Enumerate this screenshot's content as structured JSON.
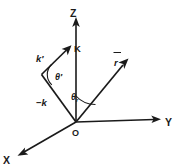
{
  "figure": {
    "background_color": "#ffffff",
    "ink_color": "#1a1a1a",
    "origin_label": "O"
  },
  "axes": [
    {
      "id": "x",
      "label": "X",
      "direction": "down-left",
      "arrow": true
    },
    {
      "id": "y",
      "label": "Y",
      "direction": "right",
      "arrow": true
    },
    {
      "id": "z",
      "label": "Z",
      "direction": "up",
      "arrow": true
    }
  ],
  "vectors": [
    {
      "id": "k-prime",
      "label": "k",
      "prime": "′",
      "overbar": false,
      "arrow": true,
      "description": "arrow from vertex up-right toward K"
    },
    {
      "id": "k-capital",
      "label": "K",
      "prime": "",
      "overbar": false,
      "arrow": false,
      "description": "label at tip near Z axis"
    },
    {
      "id": "minus-k",
      "label": "−k",
      "prime": "",
      "overbar": false,
      "arrow": false,
      "description": "segment from origin up-left to vertex"
    },
    {
      "id": "r-vector",
      "label": "r",
      "prime": "",
      "overbar": true,
      "arrow": true,
      "description": "arrow from origin up-right between Z and Y"
    }
  ],
  "angles": [
    {
      "id": "theta-prime",
      "symbol": "θ",
      "prime": "′",
      "subscript": "",
      "at": "vertex between -k and k-prime"
    },
    {
      "id": "theta-r",
      "symbol": "θ",
      "prime": "",
      "subscript": "r",
      "at": "origin between Z axis and r vector"
    }
  ]
}
